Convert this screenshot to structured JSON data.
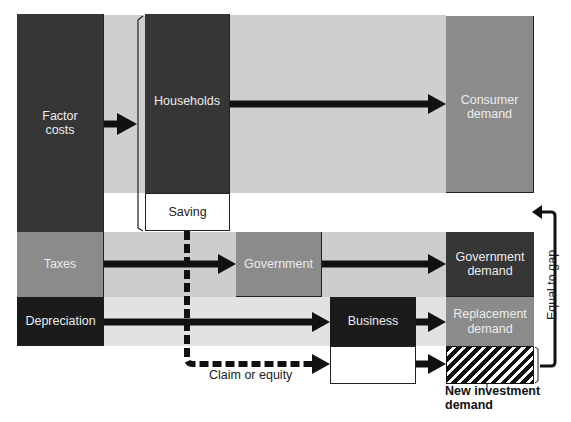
{
  "diagram": {
    "type": "flow-diagram",
    "colors": {
      "dark": "#363636",
      "black": "#1b1b1b",
      "mid_gray": "#8b8b8b",
      "light_band": "#cfcfcf",
      "lighter_band": "#e2e2e2",
      "arrow": "#111111"
    },
    "left_column": {
      "factor_costs": "Factor\ncosts",
      "taxes": "Taxes",
      "depreciation": "Depreciation"
    },
    "middle": {
      "households": "Households",
      "saving": "Saving",
      "government": "Government",
      "business": "Business"
    },
    "right_column": {
      "consumer_demand": "Consumer\ndemand",
      "government_demand": "Government\ndemand",
      "replacement_demand": "Replacement\ndemand",
      "new_investment_demand": "New investment\ndemand"
    },
    "annotations": {
      "claim_or_equity": "Claim or equity",
      "equal_to_gap": "Equal to gap"
    },
    "flows": [
      {
        "from": "Factor costs",
        "to": "Households",
        "style": "solid"
      },
      {
        "from": "Households",
        "to": "Consumer demand",
        "style": "solid"
      },
      {
        "from": "Taxes",
        "to": "Government",
        "style": "solid"
      },
      {
        "from": "Government",
        "to": "Government demand",
        "style": "solid"
      },
      {
        "from": "Depreciation",
        "to": "Business",
        "style": "solid"
      },
      {
        "from": "Business",
        "to": "Replacement demand",
        "style": "solid"
      },
      {
        "from": "Saving",
        "to": "Business (lower)",
        "style": "dashed",
        "label": "Claim or equity"
      },
      {
        "from": "Business (lower)",
        "to": "New investment demand",
        "style": "solid"
      },
      {
        "from": "New investment demand",
        "to": "gap",
        "style": "bracket-arrow",
        "label": "Equal to gap"
      }
    ]
  }
}
